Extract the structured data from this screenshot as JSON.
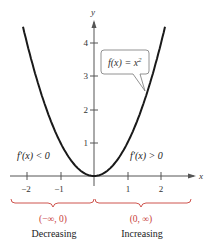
{
  "chart_data": {
    "type": "line",
    "title": "",
    "function_label": "f(x) = x²",
    "function_label_parts": {
      "lhs": "f(x) = x",
      "exp": "2"
    },
    "xlabel": "x",
    "ylabel": "y",
    "x_ticks": [
      "−2",
      "−1",
      "1",
      "2"
    ],
    "x_tick_values": [
      -2,
      -1,
      1,
      2
    ],
    "y_ticks": [
      "1",
      "2",
      "3",
      "4"
    ],
    "y_tick_values": [
      1,
      2,
      3,
      4
    ],
    "xlim": [
      -2.4,
      2.9
    ],
    "ylim": [
      0,
      4.7
    ],
    "grid": false,
    "series": [
      {
        "name": "f(x) = x^2",
        "x": [
          -2.1,
          -2,
          -1.5,
          -1,
          -0.5,
          0,
          0.5,
          1,
          1.5,
          2,
          2.1
        ],
        "y": [
          4.41,
          4,
          2.25,
          1,
          0.25,
          0,
          0.25,
          1,
          2.25,
          4,
          4.41
        ]
      }
    ],
    "annotations": {
      "left_derivative": "f′(x) < 0",
      "right_derivative": "f′(x) > 0",
      "left_interval": "(−∞, 0)",
      "right_interval": "(0, ∞)",
      "left_behavior": "Decreasing",
      "right_behavior": "Increasing"
    },
    "colors": {
      "curve": "#1a1a1a",
      "axes": "#555555",
      "brace": "#c8413a",
      "interval_text": "#c8413a",
      "text": "#222222"
    }
  }
}
